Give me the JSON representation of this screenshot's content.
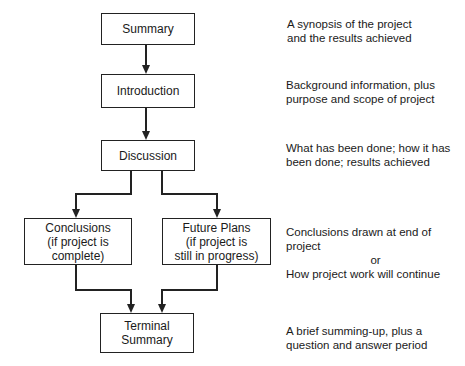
{
  "diagram": {
    "title": "",
    "boxes": [
      {
        "id": "summary",
        "lines": [
          "Summary"
        ]
      },
      {
        "id": "introduction",
        "lines": [
          "Introduction"
        ]
      },
      {
        "id": "discussion",
        "lines": [
          "Discussion"
        ]
      },
      {
        "id": "conclusions",
        "lines": [
          "Conclusions",
          "(if project is",
          "complete)"
        ]
      },
      {
        "id": "future-plans",
        "lines": [
          "Future Plans",
          "(if project is",
          "still in progress)"
        ]
      },
      {
        "id": "terminal-summary",
        "lines": [
          "Terminal",
          "Summary"
        ]
      }
    ],
    "descriptions": [
      {
        "for": "summary",
        "lines": [
          "A synopsis of the project",
          "and the results achieved"
        ]
      },
      {
        "for": "introduction",
        "lines": [
          "Background information, plus",
          "purpose and scope of project"
        ]
      },
      {
        "for": "discussion",
        "lines": [
          "What has been done; how it has",
          "been done; results achieved"
        ]
      },
      {
        "for": "conclusions-future-plans",
        "lines": [
          "Conclusions drawn at end of project",
          "or",
          "How project work will continue"
        ]
      },
      {
        "for": "terminal-summary",
        "lines": [
          "A brief summing-up, plus a",
          "question and answer period"
        ]
      }
    ],
    "edges": [
      {
        "from": "summary",
        "to": "introduction"
      },
      {
        "from": "introduction",
        "to": "discussion"
      },
      {
        "from": "discussion",
        "to": "conclusions"
      },
      {
        "from": "discussion",
        "to": "future-plans"
      },
      {
        "from": "conclusions",
        "to": "terminal-summary"
      },
      {
        "from": "future-plans",
        "to": "terminal-summary"
      }
    ],
    "colors": {
      "line": "#222222",
      "text": "#1a1a1a",
      "background": "#ffffff"
    }
  }
}
